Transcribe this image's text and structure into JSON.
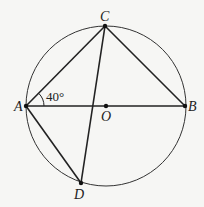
{
  "diagram": {
    "type": "circle-geometry",
    "circle": {
      "center": "O",
      "cx": 106,
      "cy": 106,
      "r": 80
    },
    "points": {
      "A": {
        "label": "A",
        "x": 26,
        "y": 106
      },
      "B": {
        "label": "B",
        "x": 185,
        "y": 106
      },
      "C": {
        "label": "C",
        "x": 105,
        "y": 26
      },
      "D": {
        "label": "D",
        "x": 81,
        "y": 183
      },
      "O": {
        "label": "O",
        "x": 106,
        "y": 106
      }
    },
    "segments": [
      "AB",
      "AC",
      "BC",
      "AD",
      "CD"
    ],
    "angle_annotation": {
      "vertex": "A",
      "between": [
        "AC",
        "AB"
      ],
      "value": "40°"
    },
    "colors": {
      "stroke": "#222222",
      "background": "#f6f6f4"
    }
  }
}
